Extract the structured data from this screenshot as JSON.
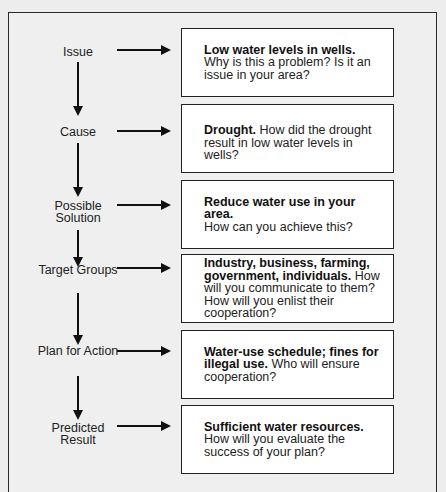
{
  "diagram": {
    "type": "flowchart",
    "steps": [
      {
        "label": "Issue",
        "bold": "Low water levels in wells.",
        "text": " Why is this a problem? Is it an issue in your area?"
      },
      {
        "label": "Cause",
        "bold": "Drought.",
        "text": " How did the drought result in low water levels in wells?"
      },
      {
        "label": "Possible Solution",
        "bold": "Reduce water use in your area.",
        "text": " How can you achieve this?"
      },
      {
        "label": "Target Groups",
        "bold": "Industry, business, farming, government, individuals.",
        "text": " How will you communicate to them? How will you enlist their cooperation?"
      },
      {
        "label": "Plan for Action",
        "bold": "Water-use schedule; fines for illegal use.",
        "text": " Who will ensure cooperation?"
      },
      {
        "label": "Predicted Result",
        "bold": "Sufficient water resources.",
        "text": " How will you evaluate the success of your plan?"
      }
    ]
  }
}
